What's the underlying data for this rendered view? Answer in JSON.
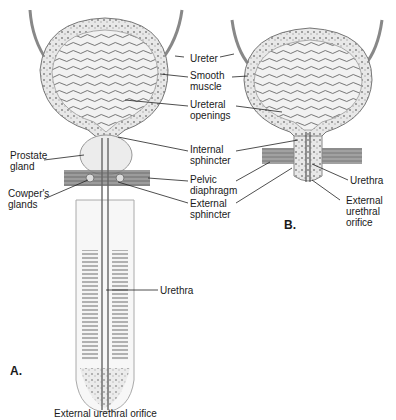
{
  "figure": {
    "panels": [
      {
        "id": "A",
        "label": "A.",
        "description": "Male bladder and urethra"
      },
      {
        "id": "B",
        "label": "B.",
        "description": "Female bladder and urethra"
      }
    ],
    "labels_center": [
      {
        "text": "Ureter"
      },
      {
        "text": "Smooth\nmuscle"
      },
      {
        "text": "Ureteral\nopenings"
      },
      {
        "text": "Internal\nsphincter"
      },
      {
        "text": "Pelvic\ndiaphragm"
      },
      {
        "text": "External\nsphincter"
      }
    ],
    "labels_left": [
      {
        "text": "Prostate\ngland"
      },
      {
        "text": "Cowper's\nglands"
      }
    ],
    "labels_right_b": [
      {
        "text": "Urethra"
      },
      {
        "text": "External\nurethral\norifice"
      }
    ],
    "labels_a_lower": [
      {
        "text": "Urethra"
      },
      {
        "text": "External urethral orifice"
      }
    ]
  }
}
